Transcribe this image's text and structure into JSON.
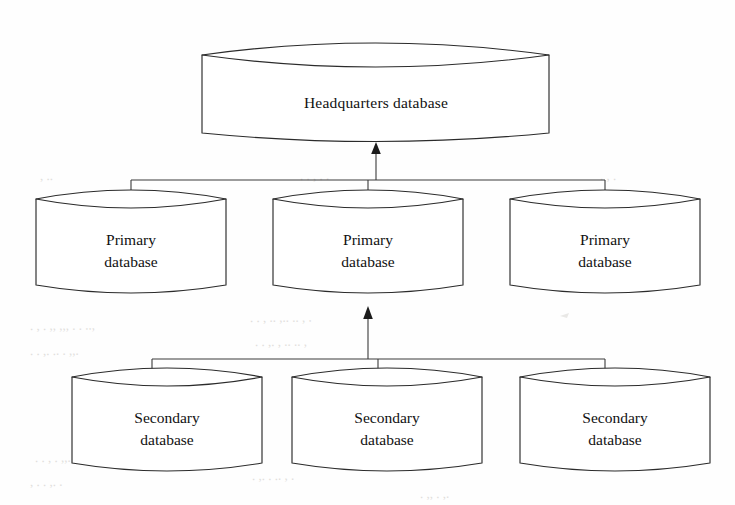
{
  "diagram": {
    "background_color": "#fefefe",
    "line_color": "#2b2b2b",
    "text_color": "#111111",
    "nodes": {
      "headquarters": {
        "label": "Headquarters database",
        "shape": "cylinder",
        "tier": "top"
      },
      "primary_left": {
        "label_line1": "Primary",
        "label_line2": "database",
        "shape": "cylinder",
        "tier": "middle"
      },
      "primary_center": {
        "label_line1": "Primary",
        "label_line2": "database",
        "shape": "cylinder",
        "tier": "middle"
      },
      "primary_right": {
        "label_line1": "Primary",
        "label_line2": "database",
        "shape": "cylinder",
        "tier": "middle"
      },
      "secondary_left": {
        "label_line1": "Secondary",
        "label_line2": "database",
        "shape": "cylinder",
        "tier": "bottom"
      },
      "secondary_center": {
        "label_line1": "Secondary",
        "label_line2": "database",
        "shape": "cylinder",
        "tier": "bottom"
      },
      "secondary_right": {
        "label_line1": "Secondary",
        "label_line2": "database",
        "shape": "cylinder",
        "tier": "bottom"
      }
    },
    "connectors": [
      {
        "name": "primary-tier-to-headquarters",
        "from": "primary tier bus",
        "to": "headquarters",
        "arrow": "up"
      },
      {
        "name": "secondary-tier-to-primary-center",
        "from": "secondary tier bus",
        "to": "primary_center",
        "arrow": "up"
      }
    ],
    "bleed_through": [
      "verso page show-through",
      "faint ghost text"
    ]
  }
}
